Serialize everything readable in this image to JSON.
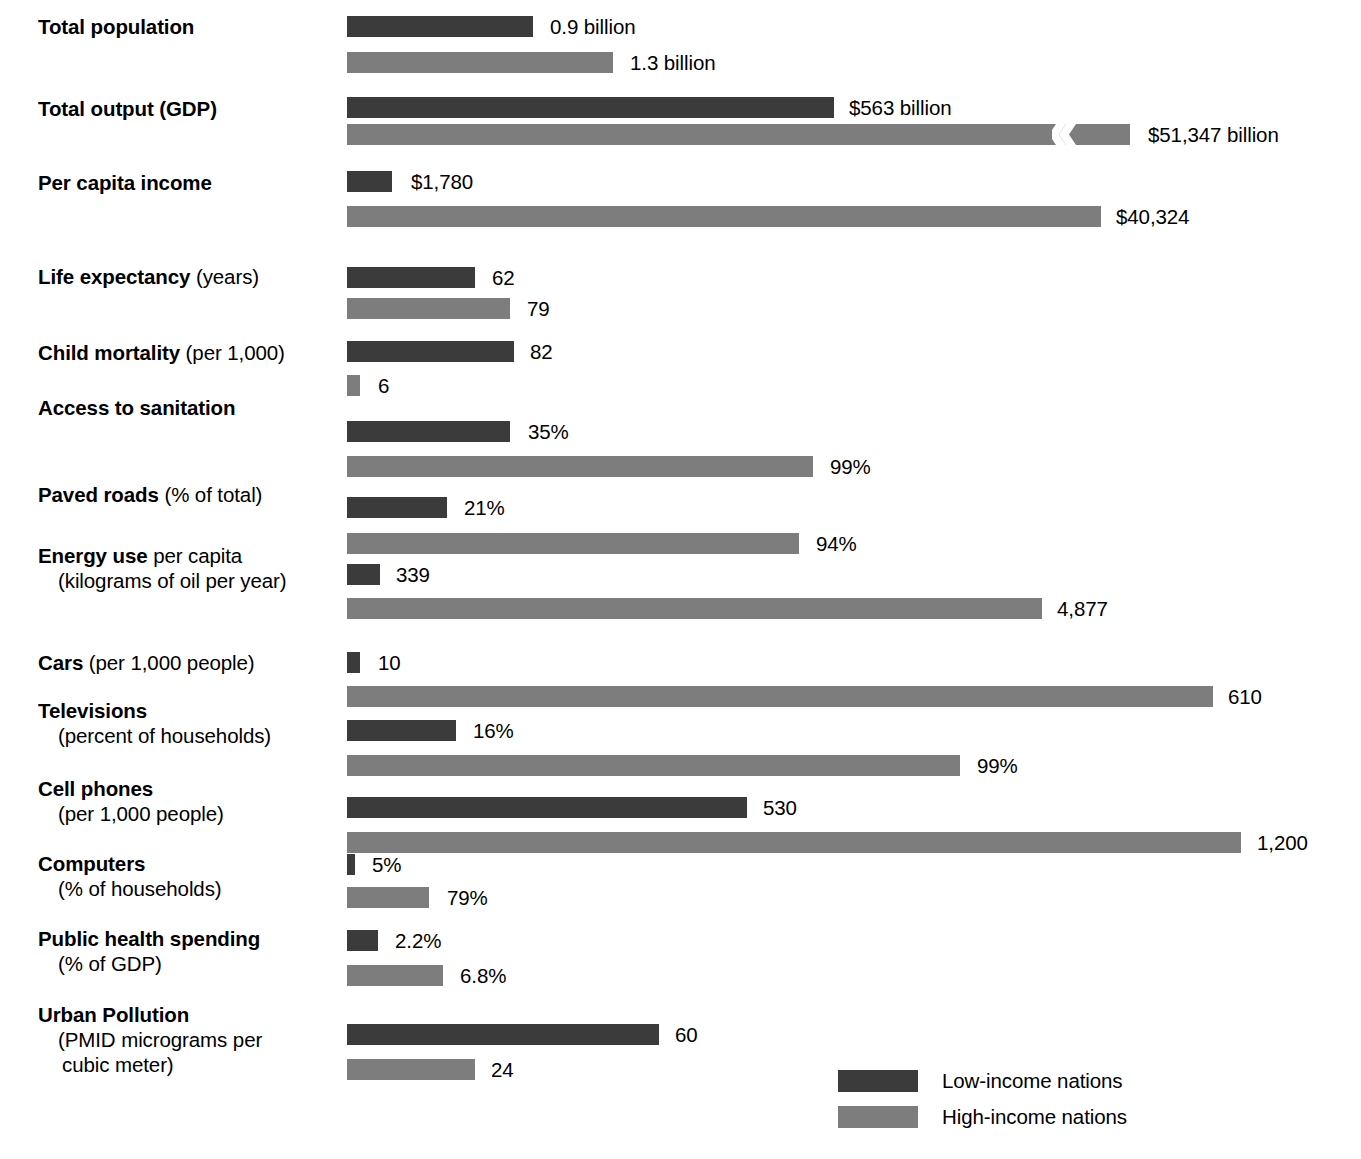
{
  "chart_data": {
    "type": "bar",
    "title": "",
    "orientation": "horizontal",
    "grid": false,
    "legend_position": "bottom-right",
    "legend": [
      "Low-income nations",
      "High-income nations"
    ],
    "series": [
      {
        "name": "Low-income nations",
        "color": "#3b3b3b",
        "values": [
          0.9,
          563,
          1780,
          62,
          82,
          35,
          21,
          339,
          10,
          16,
          530,
          5,
          2.2,
          60
        ]
      },
      {
        "name": "High-income nations",
        "color": "#7d7d7d",
        "values": [
          1.3,
          51347,
          40324,
          79,
          6,
          99,
          94,
          4877,
          610,
          99,
          1200,
          79,
          6.8,
          24
        ]
      }
    ],
    "categories": [
      "Total population",
      "Total output (GDP)",
      "Per capita income",
      "Life expectancy (years)",
      "Child mortality (per 1,000)",
      "Access to sanitation",
      "Paved roads (% of total)",
      "Energy use per capita (kilograms of oil per year)",
      "Cars (per 1,000 people)",
      "Televisions (percent of households)",
      "Cell phones (per 1,000 people)",
      "Computers (% of households)",
      "Public health spending (% of GDP)",
      "Urban Pollution (PMID micrograms per cubic meter)"
    ],
    "value_labels": {
      "low": [
        "0.9 billion",
        "$563 billion",
        "$1,780",
        "62",
        "82",
        "35%",
        "21%",
        "339",
        "10",
        "16%",
        "530",
        "5%",
        "2.2%",
        "60"
      ],
      "high": [
        "1.3 billion",
        "$51,347 billion",
        "$40,324",
        "79",
        "6",
        "99%",
        "94%",
        "4,877",
        "610",
        "99%",
        "1,200",
        "79%",
        "6.8%",
        "24"
      ]
    }
  },
  "rows": [
    {
      "id": "total-population",
      "label_lead": "Total population",
      "label_tail": "",
      "label_line2": "",
      "label_line3": "",
      "label_top": 14,
      "low": {
        "value_label": "0.9 billion",
        "top": 16,
        "width": 186,
        "label_left": 550
      },
      "high": {
        "value_label": "1.3 billion",
        "top": 52,
        "width": 266,
        "label_left": 630
      }
    },
    {
      "id": "total-output-gdp",
      "label_lead": "Total output (GDP)",
      "label_tail": "",
      "label_line2": "",
      "label_line3": "",
      "label_top": 96,
      "low": {
        "value_label": "$563 billion",
        "top": 97,
        "width": 487,
        "label_left": 849
      },
      "high": {
        "value_label": "$51,347 billion",
        "top": 124,
        "width": 783,
        "label_left": 1148,
        "break_left": 1052
      }
    },
    {
      "id": "per-capita-income",
      "label_lead": "Per capita income",
      "label_tail": "",
      "label_line2": "",
      "label_line3": "",
      "label_top": 170,
      "low": {
        "value_label": "$1,780",
        "top": 171,
        "width": 45,
        "label_left": 411
      },
      "high": {
        "value_label": "$40,324",
        "top": 206,
        "width": 754,
        "label_left": 1116
      }
    },
    {
      "id": "life-expectancy",
      "label_lead": "Life expectancy",
      "label_tail": " (years)",
      "label_line2": "",
      "label_line3": "",
      "label_top": 264,
      "low": {
        "value_label": "62",
        "top": 267,
        "width": 128,
        "label_left": 492
      },
      "high": {
        "value_label": "79",
        "top": 298,
        "width": 163,
        "label_left": 527
      }
    },
    {
      "id": "child-mortality",
      "label_lead": "Child mortality",
      "label_tail": " (per 1,000)",
      "label_line2": "",
      "label_line3": "",
      "label_top": 340,
      "low": {
        "value_label": "82",
        "top": 341,
        "width": 167,
        "label_left": 530
      },
      "high": {
        "value_label": "6",
        "top": 375,
        "width": 13,
        "label_left": 378
      }
    },
    {
      "id": "access-to-sanitation",
      "label_lead": "Access to sanitation",
      "label_tail": "",
      "label_line2": "",
      "label_line3": "",
      "label_top": 395,
      "low": {
        "value_label": "35%",
        "top": 421,
        "width": 163,
        "label_left": 528
      },
      "high": {
        "value_label": "99%",
        "top": 456,
        "width": 466,
        "label_left": 830
      }
    },
    {
      "id": "paved-roads",
      "label_lead": "Paved roads",
      "label_tail": " (% of total)",
      "label_line2": "",
      "label_line3": "",
      "label_top": 482,
      "low": {
        "value_label": "21%",
        "top": 497,
        "width": 100,
        "label_left": 464
      },
      "high": {
        "value_label": "94%",
        "top": 533,
        "width": 452,
        "label_left": 816
      }
    },
    {
      "id": "energy-use",
      "label_lead": "Energy use",
      "label_tail": " per capita",
      "label_line2": "(kilograms of oil per year)",
      "label_line3": "",
      "label_top": 543,
      "low": {
        "value_label": "339",
        "top": 564,
        "width": 33,
        "label_left": 396
      },
      "high": {
        "value_label": "4,877",
        "top": 598,
        "width": 695,
        "label_left": 1057
      }
    },
    {
      "id": "cars",
      "label_lead": "Cars",
      "label_tail": " (per 1,000 people)",
      "label_line2": "",
      "label_line3": "",
      "label_top": 650,
      "low": {
        "value_label": "10",
        "top": 652,
        "width": 13,
        "label_left": 378
      },
      "high": {
        "value_label": "610",
        "top": 686,
        "width": 866,
        "label_left": 1228
      }
    },
    {
      "id": "televisions",
      "label_lead": "Televisions",
      "label_tail": "",
      "label_line2": "(percent of households)",
      "label_line3": "",
      "label_top": 698,
      "low": {
        "value_label": "16%",
        "top": 720,
        "width": 109,
        "label_left": 473
      },
      "high": {
        "value_label": "99%",
        "top": 755,
        "width": 613,
        "label_left": 977
      }
    },
    {
      "id": "cell-phones",
      "label_lead": "Cell phones",
      "label_tail": "",
      "label_line2": "(per 1,000 people)",
      "label_line3": "",
      "label_top": 776,
      "low": {
        "value_label": "530",
        "top": 797,
        "width": 400,
        "label_left": 763
      },
      "high": {
        "value_label": "1,200",
        "top": 832,
        "width": 894,
        "label_left": 1257
      }
    },
    {
      "id": "computers",
      "label_lead": "Computers",
      "label_tail": "",
      "label_line2": "(% of households)",
      "label_line3": "",
      "label_top": 851,
      "low": {
        "value_label": "5%",
        "top": 854,
        "width": 8,
        "label_left": 372
      },
      "high": {
        "value_label": "79%",
        "top": 887,
        "width": 82,
        "label_left": 447
      }
    },
    {
      "id": "public-health-spending",
      "label_lead": "Public health spending",
      "label_tail": "",
      "label_line2": "(% of GDP)",
      "label_line3": "",
      "label_top": 926,
      "low": {
        "value_label": "2.2%",
        "top": 930,
        "width": 31,
        "label_left": 395
      },
      "high": {
        "value_label": "6.8%",
        "top": 965,
        "width": 96,
        "label_left": 460
      }
    },
    {
      "id": "urban-pollution",
      "label_lead": "Urban Pollution",
      "label_tail": "",
      "label_line2": "(PMID micrograms per",
      "label_line3": "cubic meter)",
      "label_top": 1002,
      "low": {
        "value_label": "60",
        "top": 1024,
        "width": 312,
        "label_left": 675
      },
      "high": {
        "value_label": "24",
        "top": 1059,
        "width": 128,
        "label_left": 491
      }
    }
  ],
  "legend": {
    "items": [
      {
        "label": "Low-income nations",
        "swatch": "low"
      },
      {
        "label": "High-income nations",
        "swatch": "high"
      }
    ]
  }
}
